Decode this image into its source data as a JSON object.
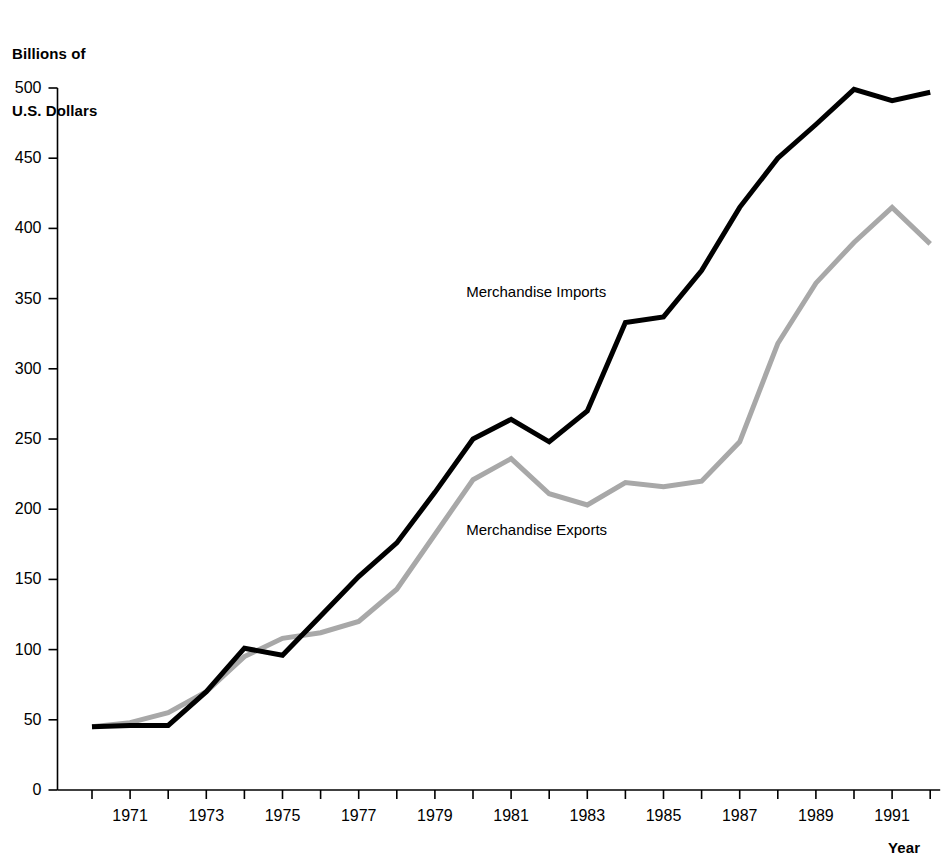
{
  "chart_data": {
    "type": "line",
    "title": "",
    "subtitle": "",
    "ylabel": "Billions of\nU.S. Dollars",
    "xlabel": "Year",
    "ylim": [
      0,
      500
    ],
    "xlim": [
      1970,
      1992
    ],
    "ytick_step": 50,
    "yticks": [
      0,
      50,
      100,
      150,
      200,
      250,
      300,
      350,
      400,
      450,
      500
    ],
    "ytick_labels": [
      "0",
      "50",
      "100",
      "150",
      "200",
      "250",
      "300",
      "350",
      "400",
      "450",
      "500"
    ],
    "x": [
      1970,
      1971,
      1972,
      1973,
      1974,
      1975,
      1976,
      1977,
      1978,
      1979,
      1980,
      1981,
      1982,
      1983,
      1984,
      1985,
      1986,
      1987,
      1988,
      1989,
      1990,
      1991,
      1992
    ],
    "xticks": [
      1970,
      1971,
      1972,
      1973,
      1974,
      1975,
      1976,
      1977,
      1978,
      1979,
      1980,
      1981,
      1982,
      1983,
      1984,
      1985,
      1986,
      1987,
      1988,
      1989,
      1990,
      1991,
      1992
    ],
    "xtick_labels": [
      "",
      "1971",
      "",
      "1973",
      "",
      "1975",
      "",
      "1977",
      "",
      "1979",
      "",
      "1981",
      "",
      "1983",
      "",
      "1985",
      "",
      "1987",
      "",
      "1989",
      "",
      "1991",
      ""
    ],
    "grid": false,
    "legend_position": "inline-annotations",
    "series": [
      {
        "name": "Merchandise Imports",
        "color": "#000000",
        "line_width": 5,
        "label_x": 1982,
        "label_y": 355,
        "values": [
          45,
          46,
          46,
          70,
          101,
          96,
          124,
          152,
          176,
          212,
          250,
          264,
          248,
          270,
          333,
          337,
          370,
          415,
          450,
          474,
          499,
          491,
          497
        ]
      },
      {
        "name": "Merchandise Exports",
        "color": "#a8a8a8",
        "line_width": 5,
        "label_x": 1982,
        "label_y": 185,
        "values": [
          45,
          48,
          55,
          70,
          95,
          108,
          112,
          120,
          143,
          182,
          221,
          236,
          211,
          203,
          219,
          216,
          220,
          248,
          318,
          361,
          390,
          415,
          389
        ]
      }
    ]
  },
  "annotations": [
    {
      "text": "Merchandise Imports",
      "series": "imports"
    },
    {
      "text": "Merchandise Exports",
      "series": "exports"
    }
  ],
  "axes": {
    "y_title": "Billions of\nU.S. Dollars",
    "y_title_line1": "Billions of",
    "y_title_line2": "U.S. Dollars",
    "x_title": "Year"
  }
}
